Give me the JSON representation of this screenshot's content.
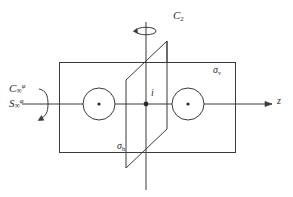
{
  "figure": {
    "stroke_color": "#3a3a3a",
    "label_color": "#2b2b2b",
    "background": "#ffffff",
    "width": 293,
    "height": 197
  },
  "labels": {
    "c2": {
      "base": "C",
      "sub": "2"
    },
    "c_infinity": {
      "base": "C",
      "sub": "∞",
      "sup": "φ"
    },
    "s_infinity": {
      "base": "S",
      "sub": "∞",
      "sup": "φ"
    },
    "sigma_v": {
      "base": "σ",
      "sub": "v"
    },
    "sigma_h": {
      "base": "σ",
      "sub": "h"
    },
    "inversion_center": "i",
    "z_axis": "z"
  },
  "elements": {
    "sigma_v_plane": {
      "name": "sigma-v vertical mirror plane",
      "shape": "rectangle",
      "x": 59,
      "y": 62,
      "width": 177,
      "height": 91
    },
    "sigma_h_plane": {
      "name": "sigma-h mirror plane",
      "shape": "parallelogram",
      "points": "167,41 126,80 126,168 167,129"
    },
    "c2_axis": {
      "name": "C2 rotation axis",
      "x": 146,
      "y1": 22,
      "y2": 190
    },
    "z_axis_line": {
      "name": "z principal axis",
      "y": 108,
      "x1": 22,
      "x2": 272
    },
    "atoms": [
      {
        "name": "left-atom",
        "cx": 99,
        "cy": 104,
        "r": 16
      },
      {
        "name": "right-atom",
        "cx": 188,
        "cy": 104,
        "r": 16
      }
    ],
    "inversion_point": {
      "cx": 146,
      "cy": 104,
      "r": 2.3
    }
  }
}
